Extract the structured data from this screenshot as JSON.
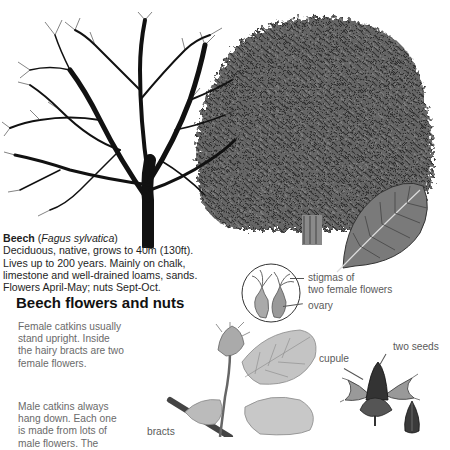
{
  "species": {
    "common_name": "Beech",
    "latin_open": "(",
    "latin_name": "Fagus sylvatica",
    "latin_close": ")",
    "description_lines": [
      "Deciduous, native, grows to 40m (130ft).",
      "Lives up to 200 years. Mainly on chalk,",
      "limestone and well-drained loams, sands.",
      "Flowers April-May; nuts Sept-Oct."
    ]
  },
  "section": {
    "title": "Beech flowers and nuts",
    "female_text_lines": [
      "Female catkins usually",
      "stand upright. Inside",
      "the hairy bracts are two",
      "female flowers."
    ],
    "male_text_lines": [
      "Male catkins always",
      "hang down. Each one",
      "is made from lots of",
      "male flowers. The"
    ]
  },
  "labels": {
    "stigmas_line1": "stigmas of",
    "stigmas_line2": "two female flowers",
    "ovary": "ovary",
    "cupule": "cupule",
    "two_seeds": "two seeds",
    "bracts": "bracts"
  },
  "illustrations": {
    "winter_tree": "bare-beech-tree-winter",
    "summer_tree": "leafy-beech-tree-summer",
    "leaf": "beech-leaf",
    "female_flower_detail": "female-flower-magnified",
    "flowering_twig": "flowering-twig",
    "nut_cupule": "beech-nut-cupule",
    "seed": "beech-seed"
  },
  "colors": {
    "background": "#ffffff",
    "text_dark": "#1e1e1e",
    "text_grey": "#6a6a6a",
    "foliage": "#5a5a5a",
    "branches": "#111111"
  }
}
